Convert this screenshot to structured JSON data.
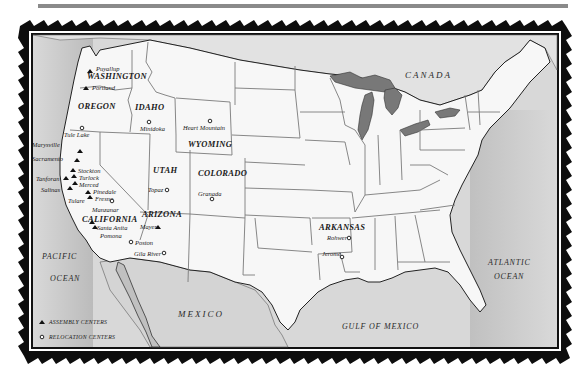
{
  "map": {
    "title": "Assembly and Relocation Centers",
    "countries": {
      "canada": "CANADA",
      "mexico": "MEXICO"
    },
    "water_bodies": {
      "pacific_line1": "PACIFIC",
      "pacific_line2": "OCEAN",
      "atlantic_line1": "ATLANTIC",
      "atlantic_line2": "OCEAN",
      "gulf": "GULF OF MEXICO"
    },
    "states": {
      "washington": "WASHINGTON",
      "oregon": "OREGON",
      "idaho": "IDAHO",
      "wyoming": "WYOMING",
      "utah": "UTAH",
      "colorado": "COLORADO",
      "arizona": "ARIZONA",
      "california": "CALIFORNIA",
      "arkansas": "ARKANSAS"
    },
    "assembly_centers": [
      {
        "name": "Puyallup"
      },
      {
        "name": "Portland"
      },
      {
        "name": "Marysville"
      },
      {
        "name": "Sacramento"
      },
      {
        "name": "Stockton"
      },
      {
        "name": "Turlock"
      },
      {
        "name": "Merced"
      },
      {
        "name": "Tanforan"
      },
      {
        "name": "Salinas"
      },
      {
        "name": "Pinedale"
      },
      {
        "name": "Fresno"
      },
      {
        "name": "Tulare"
      },
      {
        "name": "Santa Anita"
      },
      {
        "name": "Pomona"
      },
      {
        "name": "Mayer"
      }
    ],
    "relocation_centers": [
      {
        "name": "Tule Lake"
      },
      {
        "name": "Minidoka"
      },
      {
        "name": "Heart Mountain"
      },
      {
        "name": "Topaz"
      },
      {
        "name": "Granada"
      },
      {
        "name": "Manzanar"
      },
      {
        "name": "Poston"
      },
      {
        "name": "Gila River"
      },
      {
        "name": "Rohwer"
      },
      {
        "name": "Jerome"
      }
    ],
    "legend": {
      "assembly_label": "ASSEMBLY CENTERS",
      "assembly_icon": "triangle-icon",
      "relocation_label": "RELOCATION CENTERS",
      "relocation_icon": "circle-icon"
    },
    "colors": {
      "water": "#d6d6d6",
      "land": "#f7f7f7",
      "border": "#1a1a1a",
      "state_line": "#7a7a7a",
      "rule": "#8a8a8a"
    }
  }
}
